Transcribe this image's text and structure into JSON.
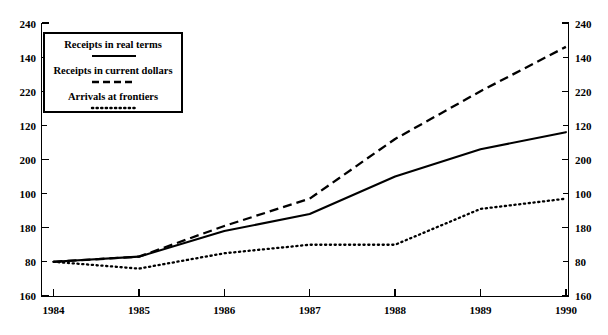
{
  "chart_data": {
    "type": "line",
    "title": "",
    "xlabel": "",
    "ylabel": "",
    "x": [
      1984,
      1985,
      1986,
      1987,
      1988,
      1989,
      1990
    ],
    "xtick_labels": [
      "1984",
      "1985",
      "1986",
      "1987",
      "1988",
      "1989",
      "1990"
    ],
    "xlim": [
      1984,
      1990
    ],
    "ylim": [
      80,
      240
    ],
    "ytick_labels": [
      "80",
      "100",
      "120",
      "140",
      "160",
      "180",
      "200",
      "220",
      "240"
    ],
    "ytick_values": [
      80,
      100,
      120,
      140,
      160,
      180,
      200,
      220,
      240
    ],
    "yminor_values": [
      90,
      110,
      130,
      150,
      170,
      190,
      210,
      230
    ],
    "grid": false,
    "legend_position": "top-left",
    "series": [
      {
        "name": "Receipts in real terms",
        "style": "solid",
        "color": "#000000",
        "values": [
          100,
          103,
          118,
          128,
          150,
          166,
          176
        ]
      },
      {
        "name": "Receipts in current dollars",
        "style": "dashed",
        "color": "#000000",
        "values": [
          100,
          103,
          121,
          137,
          172,
          200,
          226
        ]
      },
      {
        "name": "Arrivals at frontiers",
        "style": "dotted",
        "color": "#000000",
        "values": [
          100,
          96,
          105,
          110,
          110,
          131,
          137
        ]
      }
    ]
  },
  "legend": {
    "items": [
      {
        "label": "Receipts in real terms",
        "style": "solid"
      },
      {
        "label": "Receipts in current dollars",
        "style": "dashed"
      },
      {
        "label": "Arrivals at frontiers",
        "style": "dotted"
      }
    ]
  },
  "axes": {
    "left": {
      "labels": [
        "240",
        "220",
        "200",
        "180",
        "160",
        "140",
        "120",
        "100",
        "80"
      ]
    },
    "right": {
      "labels": [
        "240",
        "220",
        "200",
        "180",
        "160",
        "140",
        "120",
        "100",
        "80"
      ]
    },
    "bottom": {
      "labels": [
        "1984",
        "1985",
        "1986",
        "1987",
        "1988",
        "1989",
        "1990"
      ]
    }
  }
}
